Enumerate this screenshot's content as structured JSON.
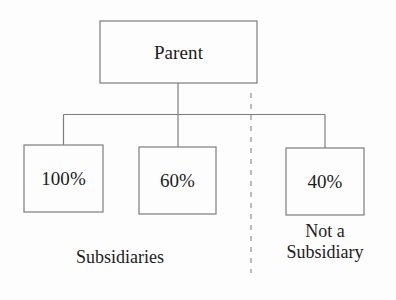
{
  "diagram": {
    "type": "org-ownership-tree",
    "colors": {
      "background": "#fdfdfd",
      "box_stroke": "#7d7d7d",
      "connector_stroke": "#7d7d7d",
      "divider_stroke": "#9a9a9a",
      "text": "#1c1c1c"
    },
    "nodes": {
      "parent": {
        "label": "Parent",
        "role": "root"
      },
      "children": [
        {
          "label": "100%",
          "ownership_percent": 100,
          "classification": "Subsidiaries"
        },
        {
          "label": "60%",
          "ownership_percent": 60,
          "classification": "Subsidiaries"
        },
        {
          "label": "40%",
          "ownership_percent": 40,
          "classification": "Not a Subsidiary"
        }
      ]
    },
    "captions": {
      "left_group": "Subsidiaries",
      "right_group_line1": "Not a",
      "right_group_line2": "Subsidiary"
    },
    "divider": {
      "style": "dashed",
      "orientation": "vertical",
      "meaning": "separates subsidiaries from non-subsidiary holding"
    }
  }
}
